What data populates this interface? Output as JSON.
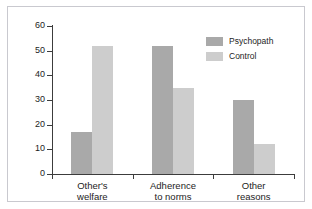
{
  "chart_data": {
    "type": "bar",
    "title": "",
    "xlabel": "",
    "ylabel": "% Responses",
    "ylim": [
      0,
      60
    ],
    "yticks": [
      0,
      10,
      20,
      30,
      40,
      50,
      60
    ],
    "ytick_labels": [
      "0",
      "10",
      "20",
      "30",
      "40",
      "50",
      "60"
    ],
    "grid": false,
    "legend_position": "top-right",
    "categories": [
      "Other's\nwelfare",
      "Adherence\nto norms",
      "Other\nreasons"
    ],
    "category_labels_flat": [
      "Other's welfare",
      "Adherence to norms",
      "Other reasons"
    ],
    "series": [
      {
        "name": "Psychopath",
        "color": "#a9a9a9",
        "values": [
          17,
          52,
          30
        ]
      },
      {
        "name": "Control",
        "color": "#cdcdcd",
        "values": [
          52,
          35,
          12
        ]
      }
    ]
  },
  "legend": {
    "items": [
      {
        "label": "Psychopath"
      },
      {
        "label": "Control"
      }
    ]
  },
  "axis": {
    "y_title": "% Responses"
  },
  "colors": {
    "psychopath": "#a9a9a9",
    "control": "#cdcdcd",
    "axis": "#3c3c3c",
    "frame": "#c9c9cf",
    "text": "#1d1d1d",
    "background": "#ffffff"
  }
}
